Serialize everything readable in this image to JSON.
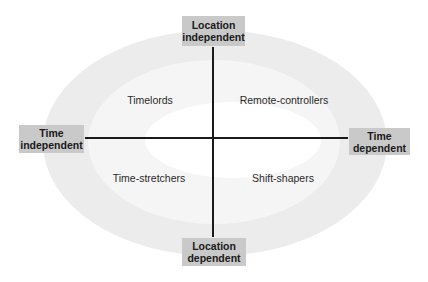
{
  "diagram": {
    "type": "quadrant-matrix",
    "axes": {
      "vertical": {
        "top": {
          "line1": "Location",
          "line2": "independent"
        },
        "bottom": {
          "line1": "Location",
          "line2": "dependent"
        }
      },
      "horizontal": {
        "left": {
          "line1": "Time",
          "line2": "independent"
        },
        "right": {
          "line1": "Time",
          "line2": "dependent"
        }
      }
    },
    "quadrants": {
      "top_left": "Timelords",
      "top_right": "Remote-controllers",
      "bottom_left": "Time-stretchers",
      "bottom_right": "Shift-shapers"
    },
    "colors": {
      "outer_ring": "#ececec",
      "middle_ring": "#f5f5f5",
      "inner_center": "#ffffff",
      "label_box": "#c9c9c9",
      "axis_line": "#1a1a1a"
    }
  }
}
